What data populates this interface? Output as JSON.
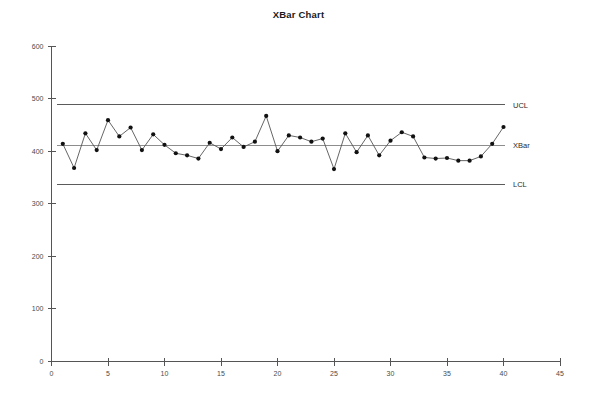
{
  "chart_data": {
    "type": "line",
    "title": "XBar Chart",
    "xlabel": "",
    "ylabel": "",
    "xlim": [
      0,
      45
    ],
    "ylim": [
      0,
      600
    ],
    "xticks": [
      0,
      5,
      10,
      15,
      20,
      25,
      30,
      35,
      40,
      45
    ],
    "yticks": [
      0,
      100,
      200,
      300,
      400,
      500,
      600
    ],
    "grid": false,
    "legend_position": "right-inline",
    "x": [
      1,
      2,
      3,
      4,
      5,
      6,
      7,
      8,
      9,
      10,
      11,
      12,
      13,
      14,
      15,
      16,
      17,
      18,
      19,
      20,
      21,
      22,
      23,
      24,
      25,
      26,
      27,
      28,
      29,
      30,
      31,
      32,
      33,
      34,
      35,
      36,
      37,
      38,
      39,
      40
    ],
    "series": [
      {
        "name": "XBar",
        "marker": "filled-circle",
        "values": [
          414,
          368,
          434,
          402,
          459,
          428,
          445,
          402,
          432,
          412,
          396,
          392,
          386,
          416,
          404,
          426,
          408,
          418,
          467,
          400,
          430,
          426,
          418,
          424,
          366,
          434,
          398,
          430,
          392,
          420,
          436,
          428,
          388,
          386,
          387,
          382,
          382,
          390,
          414,
          446
        ]
      }
    ],
    "control_limits": [
      {
        "name": "UCL",
        "label": "UCL",
        "value": 488
      },
      {
        "name": "XBar",
        "label": "XBar",
        "value": 411
      },
      {
        "name": "LCL",
        "label": "LCL",
        "value": 337
      }
    ]
  },
  "colors": {
    "background": "#ffffff",
    "axis": "#555555",
    "limit_line": "#5b5b5b",
    "center_line": "#8d8d8d",
    "data_line": "#555555",
    "data_point": "#111111",
    "tick_text": "#4a4a4a",
    "title_text": "#1a1a1a"
  }
}
